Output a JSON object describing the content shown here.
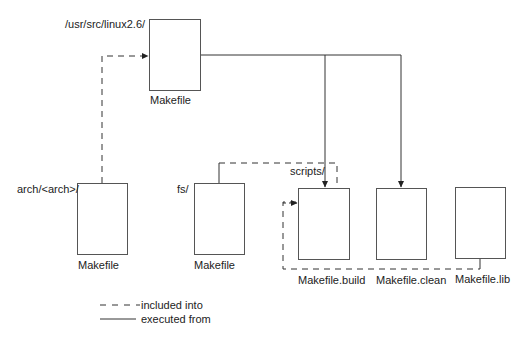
{
  "diagram": {
    "type": "makefile-hierarchy",
    "nodes": {
      "top": {
        "dir": "/usr/src/linux2.6/",
        "file": "Makefile"
      },
      "arch": {
        "dir": "arch/<arch>/",
        "file": "Makefile"
      },
      "fs": {
        "dir": "fs/",
        "file": "Makefile"
      },
      "scripts": {
        "dir": "scripts/"
      },
      "build": {
        "file": "Makefile.build"
      },
      "clean": {
        "file": "Makefile.clean"
      },
      "lib": {
        "file": "Makefile.lib"
      }
    },
    "edges": [
      {
        "from": "arch",
        "to": "top",
        "style": "dashed",
        "meaning": "included into"
      },
      {
        "from": "top",
        "to": "build",
        "style": "solid",
        "meaning": "executed from"
      },
      {
        "from": "top",
        "to": "clean",
        "style": "solid",
        "meaning": "executed from"
      },
      {
        "from": "fs",
        "to": "build",
        "style": "dashed",
        "meaning": "included into"
      },
      {
        "from": "lib",
        "to": "build",
        "style": "dashed",
        "meaning": "included into"
      }
    ],
    "legend": {
      "dashed_label": "included into",
      "solid_label": "executed from"
    },
    "colors": {
      "line": "#333333",
      "box_border": "#555555",
      "text": "#222222"
    }
  }
}
